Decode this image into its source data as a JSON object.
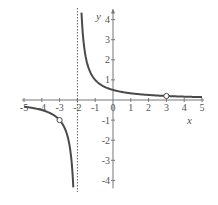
{
  "chart_data": {
    "type": "line",
    "title": "",
    "xlabel": "x",
    "ylabel": "y",
    "xlim": [
      -5,
      5
    ],
    "ylim": [
      -4.4,
      4.4
    ],
    "grid": false,
    "x_ticks": [
      -5,
      -4,
      -3,
      -2,
      -1,
      0,
      1,
      2,
      3,
      4,
      5
    ],
    "x_tick_labels": [
      "-5",
      "-4",
      "-3",
      "-2",
      "-1",
      "0",
      "1",
      "2",
      "3",
      "4",
      "5"
    ],
    "y_ticks": [
      -4,
      -3,
      -2,
      -1,
      1,
      2,
      3,
      4
    ],
    "y_tick_labels": [
      "-4",
      "-3",
      "-2",
      "-1",
      "1",
      "2",
      "3",
      "4"
    ],
    "function": "y = 1/(x+2)",
    "vertical_asymptote": {
      "x": -2,
      "style": "dotted"
    },
    "open_points": [
      {
        "x": -3,
        "y": -1
      },
      {
        "x": 3,
        "y": 0.2
      }
    ],
    "series": [
      {
        "name": "left branch",
        "x_range": [
          -5,
          -2.23
        ]
      },
      {
        "name": "right branch",
        "x_range": [
          -1.77,
          5
        ]
      }
    ],
    "colors": {
      "curve": "#4a4a4a",
      "axis": "#777777",
      "asymptote": "#555555"
    }
  }
}
